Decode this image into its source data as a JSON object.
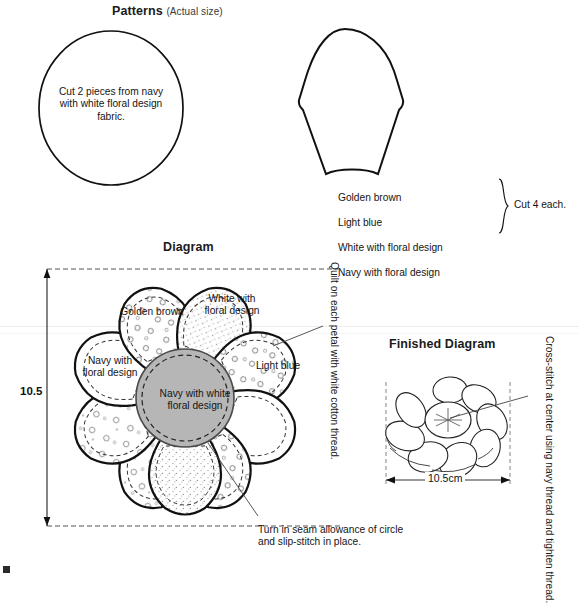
{
  "page": {
    "width": 579,
    "height": 578,
    "background": "#ffffff",
    "ink": "#111111"
  },
  "patterns_section": {
    "title": "Patterns",
    "title_suffix": "(Actual size)",
    "circle_piece": {
      "name": "circle-pattern",
      "note": "Cut 2 pieces from navy\nwith white floral design\nfabric."
    },
    "petal_piece": {
      "name": "petal-pattern",
      "fabrics": [
        "Golden brown",
        "Light blue",
        "White with floral design",
        "Navy with floral design"
      ],
      "bracket_note": "Cut 4 each."
    }
  },
  "diagram_section": {
    "title": "Diagram",
    "dimension_label": "10.5",
    "center_label": "Navy with white\nfloral design",
    "petal_labels": [
      {
        "label": "Golden brown",
        "fill": "stipple"
      },
      {
        "label": "White with\nfloral design",
        "fill": "floral"
      },
      {
        "label": "Light blue",
        "fill": "plain"
      },
      {
        "label": "Navy with\nfloral design",
        "fill": "floral"
      }
    ],
    "callout_right": "Quilt on each petal with white cotton thread.",
    "callout_bottom": "Turn in seam allowance of circle\nand slip-stitch in place.",
    "center_fill_color": "#b6b6b6"
  },
  "finished_section": {
    "title": "Finished Diagram",
    "dimension_label": "10.5cm",
    "callout_right": "Cross-stitch at center using navy thread\nand tighten thread."
  }
}
